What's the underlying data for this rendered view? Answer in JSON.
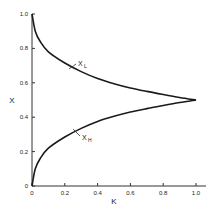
{
  "chart_data": {
    "type": "line",
    "title": "",
    "xlabel": "K",
    "ylabel": "X",
    "xlim": [
      0,
      1.0
    ],
    "ylim": [
      0,
      1.0
    ],
    "xticks": [
      "0",
      "0.2",
      "0.4",
      "0.6",
      "0.8",
      "1.0"
    ],
    "yticks": [
      "0",
      "0.2",
      "0.4",
      "0.6",
      "0.8",
      "1.0"
    ],
    "grid": false,
    "legend": "inline curve labels",
    "x": [
      0,
      0.02,
      0.05,
      0.1,
      0.2,
      0.3,
      0.4,
      0.5,
      0.6,
      0.7,
      0.8,
      0.9,
      1.0
    ],
    "series": [
      {
        "name": "X_L",
        "label_main": "X",
        "label_sub": "L",
        "values": [
          1.0,
          0.9,
          0.84,
          0.78,
          0.715,
          0.665,
          0.625,
          0.595,
          0.57,
          0.55,
          0.532,
          0.515,
          0.5
        ]
      },
      {
        "name": "X_H",
        "label_main": "X",
        "label_sub": "H",
        "values": [
          0.0,
          0.1,
          0.16,
          0.22,
          0.285,
          0.335,
          0.375,
          0.405,
          0.43,
          0.45,
          0.468,
          0.485,
          0.5
        ]
      }
    ]
  },
  "colors": {
    "line": "#1a1a1a",
    "axis": "#333333",
    "background": "#ffffff"
  }
}
